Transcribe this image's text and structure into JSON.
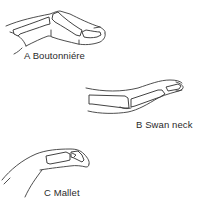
{
  "figure": {
    "panels": [
      {
        "id": "A",
        "letter": "A",
        "name": "Boutonniére",
        "label": "A  Boutonniére"
      },
      {
        "id": "B",
        "letter": "B",
        "name": "Swan neck",
        "label": "B  Swan neck"
      },
      {
        "id": "C",
        "letter": "C",
        "name": "Mallet",
        "label": "C  Mallet"
      }
    ],
    "colors": {
      "line": "#3a3a3a",
      "text": "#2a2a2a",
      "background": "#ffffff"
    }
  }
}
